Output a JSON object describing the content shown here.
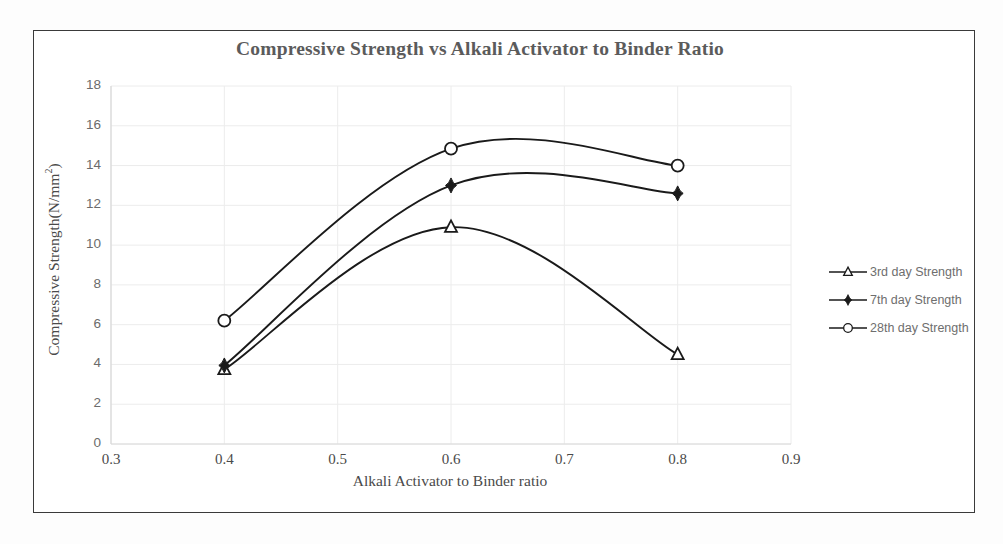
{
  "chart_data": {
    "type": "line",
    "title": "Compressive Strength vs Alkali Activator to Binder Ratio",
    "xlabel": "Alkali Activator to Binder ratio",
    "ylabel": "Compressive Strength(N/mm2)",
    "ylabel_base": "Compressive Strength(N/mm",
    "ylabel_sup": "2",
    "ylabel_tail": ")",
    "x": [
      0.4,
      0.6,
      0.8
    ],
    "xlim": [
      0.3,
      0.9
    ],
    "ylim": [
      0,
      18
    ],
    "xticks": [
      "0.3",
      "0.4",
      "0.5",
      "0.6",
      "0.7",
      "0.8",
      "0.9"
    ],
    "xtick_values": [
      0.3,
      0.4,
      0.5,
      0.6,
      0.7,
      0.8,
      0.9
    ],
    "yticks": [
      "18",
      "16",
      "14",
      "12",
      "10",
      "8",
      "6",
      "4",
      "2",
      "0"
    ],
    "ytick_values": [
      18,
      16,
      14,
      12,
      10,
      8,
      6,
      4,
      2,
      0
    ],
    "grid": true,
    "legend_position": "right",
    "smoothing": "spline",
    "series": [
      {
        "name": "3rd day Strength",
        "marker": "open-triangle",
        "color": "#1a1a1a",
        "values": [
          3.75,
          10.9,
          4.5
        ]
      },
      {
        "name": "7th day Strength",
        "marker": "filled-diamond",
        "color": "#1a1a1a",
        "values": [
          3.95,
          13.0,
          12.6
        ]
      },
      {
        "name": "28th day Strength",
        "marker": "open-circle",
        "color": "#1a1a1a",
        "values": [
          6.2,
          14.85,
          14.0
        ]
      }
    ]
  },
  "legend": {
    "items": [
      {
        "label": "3rd day Strength",
        "marker": "open-triangle"
      },
      {
        "label": "7th day Strength",
        "marker": "filled-diamond"
      },
      {
        "label": "28th day Strength",
        "marker": "open-circle"
      }
    ]
  },
  "colors": {
    "frame": "#3a3a3a",
    "title": "#5b5b5b",
    "tick_text": "#6b6b6b",
    "axis_line": "#d9d9d9",
    "grid_line": "#ececec",
    "curve": "#1a1a1a",
    "legend_text": "#6e6e6e"
  }
}
